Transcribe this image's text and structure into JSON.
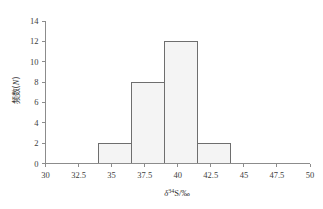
{
  "chart_data": {
    "type": "bar",
    "title": "",
    "subtitle": "",
    "xlabel_plain": "δ34S/‰",
    "xlabel_parts": {
      "symbol": "δ",
      "superscript": "34",
      "element": "S",
      "unit": "/‰"
    },
    "ylabel_plain": "频数(N)",
    "ylabel_parts": {
      "cjk": "频数(",
      "variable": "N",
      "close": ")"
    },
    "xlim": [
      30,
      50
    ],
    "ylim": [
      0,
      14
    ],
    "xticks": [
      30,
      32.5,
      35,
      37.5,
      40,
      42.5,
      45,
      47.5,
      50
    ],
    "xtick_labels": [
      "30",
      "32.5",
      "35",
      "37.5",
      "40",
      "42.5",
      "45",
      "47.5",
      "50"
    ],
    "yticks": [
      0,
      2,
      4,
      6,
      8,
      10,
      12,
      14
    ],
    "ytick_labels": [
      "0",
      "2",
      "4",
      "6",
      "8",
      "10",
      "12",
      "14"
    ],
    "grid": false,
    "legend": false,
    "bin_width": 2.5,
    "bins": [
      {
        "x0": 34.0,
        "x1": 36.5,
        "value": 2
      },
      {
        "x0": 36.5,
        "x1": 39.0,
        "value": 8
      },
      {
        "x0": 39.0,
        "x1": 41.5,
        "value": 12
      },
      {
        "x0": 41.5,
        "x1": 44.0,
        "value": 2
      }
    ],
    "categories": [
      "34.0-36.5",
      "36.5-39.0",
      "39.0-41.5",
      "41.5-44.0"
    ],
    "values": [
      2,
      8,
      12,
      2
    ],
    "total_count": 24,
    "bar_fill_color": "#f4f4f4",
    "bar_edge_color": "#6e6e6e",
    "axis_color": "#8c8c8c",
    "text_color": "#3d3d3d"
  }
}
